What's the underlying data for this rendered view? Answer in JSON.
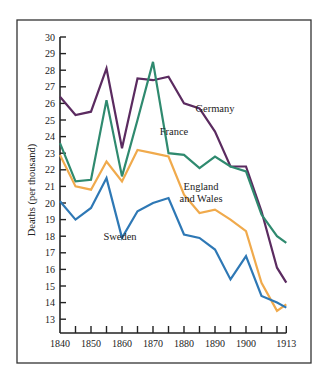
{
  "chart_data": {
    "type": "line",
    "title": "",
    "xlabel": "",
    "ylabel": "Deaths (per thousand)",
    "ylim": [
      13,
      30
    ],
    "xlim": [
      1840,
      1913
    ],
    "grid": false,
    "legend_position": "inline labels",
    "y_ticks": [
      13,
      14,
      15,
      16,
      17,
      18,
      19,
      20,
      21,
      22,
      23,
      24,
      25,
      26,
      27,
      28,
      29,
      30
    ],
    "x_tick_labels": [
      "1840",
      "1850",
      "1860",
      "1870",
      "1880",
      "1890",
      "1900",
      "1913"
    ],
    "x_minor_ticks": [
      1845,
      1850,
      1855,
      1860,
      1865,
      1870,
      1875,
      1880,
      1885,
      1890,
      1895,
      1900,
      1905,
      1910,
      1913
    ],
    "x": [
      1840,
      1845,
      1850,
      1855,
      1860,
      1865,
      1870,
      1875,
      1880,
      1885,
      1890,
      1895,
      1900,
      1905,
      1910,
      1913
    ],
    "series": [
      {
        "name": "Germany",
        "color": "#5b2b60",
        "label_lines": [
          "Germany"
        ],
        "label_pos": [
          215,
          112
        ],
        "values": [
          26.4,
          25.3,
          25.5,
          28.1,
          23.3,
          27.5,
          27.4,
          27.6,
          26.0,
          25.7,
          24.3,
          22.2,
          22.2,
          19.5,
          16.1,
          15.2
        ]
      },
      {
        "name": "France",
        "color": "#2f8a6f",
        "label_lines": [
          "France"
        ],
        "label_pos": [
          174,
          135
        ],
        "values": [
          23.6,
          21.3,
          21.4,
          26.2,
          21.6,
          25.0,
          28.5,
          23.0,
          22.9,
          22.1,
          22.8,
          22.2,
          21.9,
          19.3,
          18.0,
          17.6
        ]
      },
      {
        "name": "England and Wales",
        "color": "#f0aa4c",
        "label_lines": [
          "England",
          "and Wales"
        ],
        "label_pos": [
          201,
          190
        ],
        "values": [
          22.9,
          21.0,
          20.8,
          22.5,
          21.3,
          23.2,
          23.0,
          22.8,
          20.5,
          19.4,
          19.6,
          19.0,
          18.3,
          15.2,
          13.5,
          13.9
        ]
      },
      {
        "name": "Sweden",
        "color": "#2e78b5",
        "label_lines": [
          "Sweden"
        ],
        "label_pos": [
          120,
          240
        ],
        "values": [
          20.1,
          19.0,
          19.7,
          21.5,
          17.9,
          19.5,
          20.0,
          20.3,
          18.1,
          17.9,
          17.2,
          15.4,
          16.8,
          14.4,
          14.0,
          13.7
        ]
      }
    ]
  }
}
